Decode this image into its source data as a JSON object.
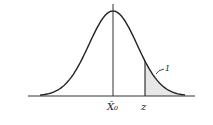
{
  "diagram": {
    "type": "normal-distribution-curve",
    "labels": {
      "mean": "X̄₀",
      "threshold": "z",
      "tail_region": "1"
    },
    "colors": {
      "ink": "#222222",
      "tail_fill": "#cfcfcf"
    }
  }
}
